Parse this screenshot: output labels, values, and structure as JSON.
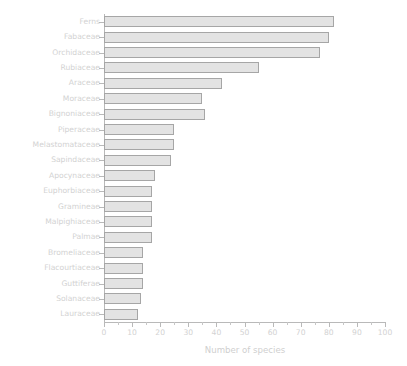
{
  "chart_data": {
    "type": "bar",
    "orientation": "horizontal",
    "title": "",
    "xlabel": "Number of species",
    "ylabel": "",
    "xlim": [
      0,
      100
    ],
    "xticks": [
      0,
      10,
      20,
      30,
      40,
      50,
      60,
      70,
      80,
      90,
      100
    ],
    "xtick_labels": [
      "0",
      "10",
      "20",
      "30",
      "40",
      "50",
      "60",
      "70",
      "80",
      "90",
      "100"
    ],
    "minor_tick_step": 5,
    "grid": false,
    "legend": null,
    "categories": [
      "Ferns",
      "Fabaceae",
      "Orchidaceae",
      "Rubiaceae",
      "Araceae",
      "Moraceae",
      "Bignoniaceae",
      "Piperaceae",
      "Melastomataceae",
      "Sapindaceae",
      "Apocynaceae",
      "Euphorbiaceae",
      "Gramineae",
      "Malpighiaceae",
      "Palmae",
      "Bromeliaceae",
      "Flacourtiaceae",
      "Guttiferae",
      "Solanaceae",
      "Lauraceae"
    ],
    "values": [
      82,
      80,
      77,
      55,
      42,
      35,
      36,
      25,
      25,
      24,
      18,
      17,
      17,
      17,
      17,
      14,
      14,
      14,
      13,
      12
    ],
    "bar_fill_color": "#e3e3e3",
    "bar_edge_color": "#a6a6a6",
    "axis_color": "#b9b9b9",
    "text_color": "#d2d2d2",
    "background_color": "#ffffff"
  }
}
